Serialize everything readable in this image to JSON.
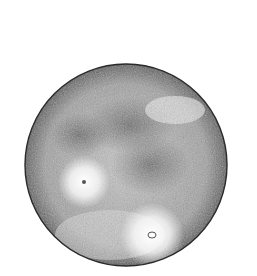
{
  "image": {
    "subject": "pen-and-ink illustration of the full moon",
    "background_color": "#ffffff",
    "moon": {
      "base_color": "#8a8a8a",
      "dark_color": "#3a3a3a",
      "highlight_color": "#ffffff",
      "maria": [
        "upper-center dark region",
        "center-right dark region"
      ],
      "ray_craters": [
        "left-center bright crater",
        "lower-right bright crater"
      ]
    }
  }
}
